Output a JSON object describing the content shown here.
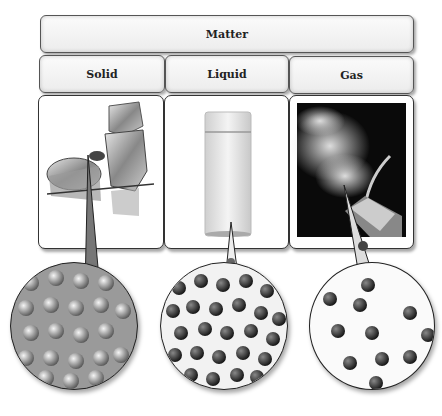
{
  "diagram": {
    "title": "Matter",
    "states": [
      {
        "label": "Solid",
        "image": "ice-cubes",
        "model": "ordered-lattice"
      },
      {
        "label": "Liquid",
        "image": "glass-of-water",
        "model": "close-random-packing"
      },
      {
        "label": "Gas",
        "image": "steam-from-kettle",
        "model": "widely-spaced-molecules"
      }
    ]
  }
}
